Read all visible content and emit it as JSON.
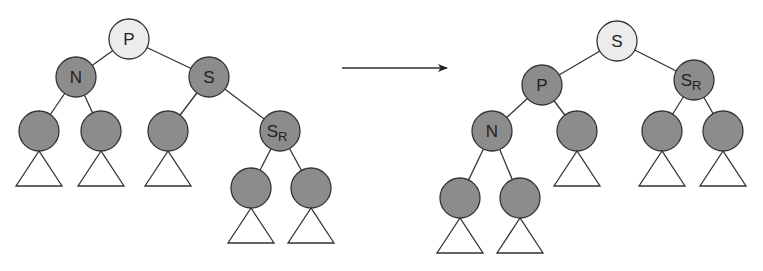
{
  "diagram": {
    "type": "tree-rotation",
    "colors": {
      "root_fill": "#ececec",
      "node_fill": "#8c8c8c",
      "stroke": "#333333",
      "label": "#222222",
      "subtree_fill": "#ffffff"
    },
    "arrow": {
      "x1": 342,
      "y1": 68,
      "x2": 447,
      "y2": 68
    },
    "before": {
      "nodes": [
        {
          "id": "P",
          "label": "P",
          "sub": "",
          "x": 129,
          "y": 39,
          "root": true
        },
        {
          "id": "N",
          "label": "N",
          "sub": "",
          "x": 76,
          "y": 77
        },
        {
          "id": "S",
          "label": "S",
          "sub": "",
          "x": 209,
          "y": 77
        },
        {
          "id": "N_L",
          "label": "",
          "sub": "",
          "x": 39,
          "y": 131
        },
        {
          "id": "N_R",
          "label": "",
          "sub": "",
          "x": 101,
          "y": 131
        },
        {
          "id": "S_L",
          "label": "",
          "sub": "",
          "x": 168,
          "y": 131
        },
        {
          "id": "SR",
          "label": "S",
          "sub": "R",
          "x": 280,
          "y": 131
        },
        {
          "id": "SR_L",
          "label": "",
          "sub": "",
          "x": 251,
          "y": 188
        },
        {
          "id": "SR_R",
          "label": "",
          "sub": "",
          "x": 311,
          "y": 188
        }
      ],
      "edges": [
        [
          "P",
          "N"
        ],
        [
          "P",
          "S"
        ],
        [
          "N",
          "N_L"
        ],
        [
          "N",
          "N_R"
        ],
        [
          "S",
          "S_L"
        ],
        [
          "S",
          "SR"
        ],
        [
          "SR",
          "SR_L"
        ],
        [
          "SR",
          "SR_R"
        ]
      ],
      "subtrees": [
        "N_L",
        "N_R",
        "S_L",
        "SR_L",
        "SR_R"
      ]
    },
    "after": {
      "nodes": [
        {
          "id": "S",
          "label": "S",
          "sub": "",
          "x": 617,
          "y": 41,
          "root": true
        },
        {
          "id": "P",
          "label": "P",
          "sub": "",
          "x": 542,
          "y": 85
        },
        {
          "id": "SR",
          "label": "S",
          "sub": "R",
          "x": 694,
          "y": 80
        },
        {
          "id": "N",
          "label": "N",
          "sub": "",
          "x": 492,
          "y": 131
        },
        {
          "id": "S_L",
          "label": "",
          "sub": "",
          "x": 577,
          "y": 131
        },
        {
          "id": "SR_L",
          "label": "",
          "sub": "",
          "x": 662,
          "y": 131
        },
        {
          "id": "SR_R",
          "label": "",
          "sub": "",
          "x": 723,
          "y": 131
        },
        {
          "id": "N_L",
          "label": "",
          "sub": "",
          "x": 460,
          "y": 198
        },
        {
          "id": "N_R",
          "label": "",
          "sub": "",
          "x": 520,
          "y": 198
        }
      ],
      "edges": [
        [
          "S",
          "P"
        ],
        [
          "S",
          "SR"
        ],
        [
          "P",
          "N"
        ],
        [
          "P",
          "S_L"
        ],
        [
          "SR",
          "SR_L"
        ],
        [
          "SR",
          "SR_R"
        ],
        [
          "N",
          "N_L"
        ],
        [
          "N",
          "N_R"
        ]
      ],
      "subtrees": [
        "S_L",
        "SR_L",
        "SR_R",
        "N_L",
        "N_R"
      ]
    },
    "node_radius": 20,
    "subtree_triangle": {
      "half_width": 23,
      "height": 35
    }
  }
}
